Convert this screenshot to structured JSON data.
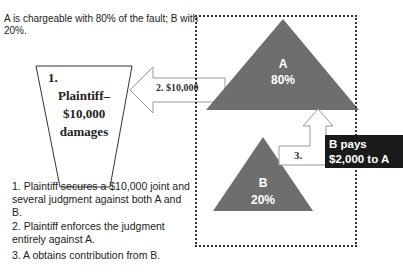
{
  "caption": "A is chargeable with 80% of the fault; B with 20%.",
  "plaintiff_box": {
    "step": "1.",
    "label": "Plaintiff–",
    "amount": "$10,000",
    "sub": "damages"
  },
  "arrow_2": {
    "label": "2.  $10,000"
  },
  "triangle_a": {
    "name": "A",
    "percent": "80%",
    "color": "#6e6e6e"
  },
  "triangle_b": {
    "name": "B",
    "percent": "20%",
    "color": "#6e6e6e"
  },
  "arrow_3": {
    "label": "3."
  },
  "callout": {
    "line1": "B pays",
    "line2": "$2,000 to A"
  },
  "notes": [
    "1. Plaintiff secures a $10,000 joint and several judgment against both A and B.",
    "2. Plaintiff enforces the judgment entirely against A.",
    "3. A obtains contribution from B."
  ]
}
